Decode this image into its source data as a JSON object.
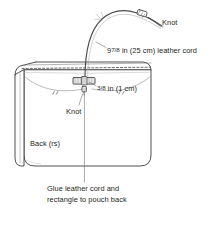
{
  "figure": {
    "background_color": "#ffffff",
    "line_color": "#3c3c3c",
    "text_color": "#231f20",
    "width": 223,
    "height": 239
  },
  "labels": {
    "knot_top": "Knot",
    "cord_length_whole": "9",
    "cord_length_fraction": "7/8",
    "cord_length_rest": " in (25 cm) leather cord",
    "tab_width_fraction": "3/8",
    "tab_width_rest": " in (1 cm)",
    "knot_middle": "Knot",
    "back_rs": "Back (rs)",
    "caption": "Glue leather cord and rectangle to pouch back"
  },
  "parts": {
    "pouch_body": "pouch-back-panel",
    "pouch_gusset": "pouch-side-gusset",
    "pouch_top_flap": "pouch-top-edge-stitching",
    "leather_cord": "leather-cord-loop",
    "cord_knot_top": "cord-knot-upper",
    "cord_knot_lower": "cord-knot-lower",
    "leather_rectangle": "glued-leather-rectangle",
    "leader_lines": "callout-leader-lines"
  }
}
